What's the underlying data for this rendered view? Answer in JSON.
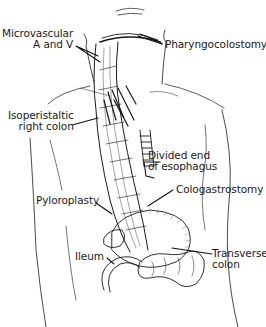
{
  "figure": {
    "labels": {
      "microvascular": {
        "line1": "Microvascular",
        "line2": "A and V"
      },
      "pharyngocolostomy": {
        "line1": "Pharyngocolostomy"
      },
      "isoperistaltic": {
        "line1": "Isoperistaltic",
        "line2": "right colon"
      },
      "divided_end": {
        "line1": "Divided end",
        "line2": "of esophagus"
      },
      "pyloroplasty": {
        "line1": "Pyloroplasty"
      },
      "cologastrostomy": {
        "line1": "Cologastrostomy"
      },
      "ileum": {
        "line1": "Ileum"
      },
      "transverse_colon": {
        "line1": "Transverse",
        "line2": "colon"
      }
    },
    "colors": {
      "ink": "#1a1a1a",
      "background": "#ffffff",
      "hatch": "#555555"
    }
  }
}
